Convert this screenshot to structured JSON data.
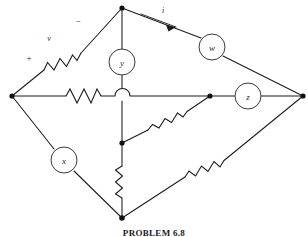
{
  "figure": {
    "caption": "PROBLEM 6.8",
    "width": 308,
    "height": 237,
    "background": "#ffffff",
    "ink_color": "#1b1b1b"
  },
  "elements": [
    {
      "id": "w",
      "label": "w",
      "cx": 212,
      "cy": 47,
      "r": 13,
      "kind": "circle-element"
    },
    {
      "id": "y",
      "label": "y",
      "cx": 122,
      "cy": 62,
      "r": 13,
      "kind": "circle-element"
    },
    {
      "id": "z",
      "label": "z",
      "cx": 248,
      "cy": 96,
      "r": 13,
      "kind": "circle-element"
    },
    {
      "id": "x",
      "label": "x",
      "cx": 64,
      "cy": 160,
      "r": 13,
      "kind": "circle-element"
    }
  ],
  "annotations": [
    {
      "id": "v",
      "label": "v",
      "x": 49,
      "y": 38,
      "kind": "voltage-label"
    },
    {
      "id": "plus",
      "label": "+",
      "x": 29,
      "y": 58,
      "kind": "polarity-plus"
    },
    {
      "id": "minus",
      "label": "−",
      "x": 78,
      "y": 21,
      "kind": "polarity-minus"
    },
    {
      "id": "i",
      "label": "i",
      "x": 163,
      "y": 10,
      "kind": "current-label"
    }
  ],
  "nodes": [
    {
      "id": "top",
      "x": 122,
      "y": 8
    },
    {
      "id": "left",
      "x": 12,
      "y": 96
    },
    {
      "id": "right",
      "x": 303,
      "y": 96
    },
    {
      "id": "bottom",
      "x": 122,
      "y": 218
    },
    {
      "id": "mid-right",
      "x": 210,
      "y": 96
    },
    {
      "id": "mid-low",
      "x": 122,
      "y": 143
    }
  ],
  "resistors": [
    {
      "id": "r-upper-left",
      "on": "left-to-top branch"
    },
    {
      "id": "r-horizontal",
      "on": "left-to-center branch"
    },
    {
      "id": "r-diagonal",
      "on": "mid-low-to-mid-right branch"
    },
    {
      "id": "r-vertical",
      "on": "mid-low-to-bottom branch"
    },
    {
      "id": "r-lower-right",
      "on": "bottom-to-right branch"
    }
  ]
}
